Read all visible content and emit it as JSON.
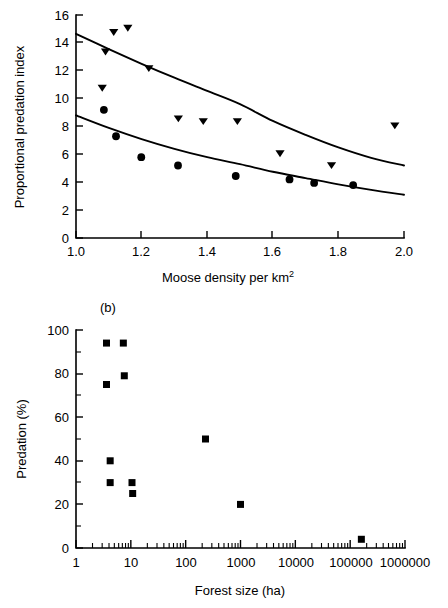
{
  "figure": {
    "background_color": "#ffffff",
    "ink_color": "#000000"
  },
  "panel_a": {
    "label": "",
    "ylabel": "Proportional predation index",
    "xlabel_main": "Moose density per km",
    "xlabel_exponent": "2",
    "y_ticks": [
      "0",
      "2",
      "4",
      "6",
      "8",
      "10",
      "12",
      "14",
      "16"
    ],
    "x_ticks": [
      "1.0",
      "1.2",
      "1.4",
      "1.6",
      "1.8",
      "2.0"
    ]
  },
  "panel_b": {
    "label": "(b)",
    "ylabel": "Predation (%)",
    "xlabel": "Forest size (ha)",
    "y_ticks": [
      "0",
      "20",
      "40",
      "60",
      "80",
      "100"
    ],
    "x_ticks": [
      "1",
      "10",
      "100",
      "1000",
      "10000",
      "100000",
      "1000000"
    ]
  },
  "chart_data": [
    {
      "type": "scatter",
      "title": "Proportional predation index vs Moose density",
      "xlabel": "Moose density per km^2",
      "ylabel": "Proportional predation index",
      "xlim": [
        1.0,
        2.0
      ],
      "ylim": [
        0,
        16
      ],
      "grid": false,
      "legend_position": "none",
      "xticks": [
        1.0,
        1.2,
        1.4,
        1.6,
        1.8,
        2.0
      ],
      "yticks": [
        0,
        2,
        4,
        6,
        8,
        10,
        12,
        14,
        16
      ],
      "series": [
        {
          "name": "upper-series-triangles",
          "marker": "triangle-down",
          "points": [
            {
              "x": 1.08,
              "y": 10.8
            },
            {
              "x": 1.09,
              "y": 13.4
            },
            {
              "x": 1.115,
              "y": 14.8
            },
            {
              "x": 1.158,
              "y": 15.1
            },
            {
              "x": 1.222,
              "y": 12.2
            },
            {
              "x": 1.312,
              "y": 8.6
            },
            {
              "x": 1.388,
              "y": 8.4
            },
            {
              "x": 1.492,
              "y": 8.4
            },
            {
              "x": 1.622,
              "y": 6.1
            },
            {
              "x": 1.779,
              "y": 5.25
            },
            {
              "x": 1.972,
              "y": 8.1
            }
          ]
        },
        {
          "name": "lower-series-circles",
          "marker": "circle",
          "points": [
            {
              "x": 1.085,
              "y": 9.2
            },
            {
              "x": 1.122,
              "y": 7.3
            },
            {
              "x": 1.199,
              "y": 5.8
            },
            {
              "x": 1.311,
              "y": 5.2
            },
            {
              "x": 1.487,
              "y": 4.45
            },
            {
              "x": 1.651,
              "y": 4.2
            },
            {
              "x": 1.726,
              "y": 3.95
            },
            {
              "x": 1.845,
              "y": 3.8
            }
          ]
        }
      ],
      "fitted_curves": [
        {
          "name": "upper-fit-curve",
          "form": "exponential-decay",
          "points": [
            {
              "x": 1.0,
              "y": 14.65
            },
            {
              "x": 1.1,
              "y": 13.55
            },
            {
              "x": 1.2,
              "y": 12.5
            },
            {
              "x": 1.3,
              "y": 11.5
            },
            {
              "x": 1.4,
              "y": 10.55
            },
            {
              "x": 1.5,
              "y": 9.6
            },
            {
              "x": 1.6,
              "y": 8.4
            },
            {
              "x": 1.7,
              "y": 7.4
            },
            {
              "x": 1.8,
              "y": 6.5
            },
            {
              "x": 1.9,
              "y": 5.75
            },
            {
              "x": 2.0,
              "y": 5.2
            }
          ]
        },
        {
          "name": "lower-fit-curve",
          "form": "exponential-decay",
          "points": [
            {
              "x": 1.0,
              "y": 8.8
            },
            {
              "x": 1.1,
              "y": 7.9
            },
            {
              "x": 1.2,
              "y": 7.1
            },
            {
              "x": 1.3,
              "y": 6.4
            },
            {
              "x": 1.4,
              "y": 5.8
            },
            {
              "x": 1.5,
              "y": 5.3
            },
            {
              "x": 1.6,
              "y": 4.75
            },
            {
              "x": 1.7,
              "y": 4.3
            },
            {
              "x": 1.8,
              "y": 3.85
            },
            {
              "x": 1.9,
              "y": 3.45
            },
            {
              "x": 2.0,
              "y": 3.1
            }
          ]
        }
      ]
    },
    {
      "type": "scatter",
      "title": "(b) Predation vs Forest size",
      "xlabel": "Forest size (ha)",
      "ylabel": "Predation (%)",
      "xscale": "log",
      "xlim": [
        1,
        1000000
      ],
      "ylim": [
        0,
        100
      ],
      "grid": false,
      "legend_position": "none",
      "xticks": [
        1,
        10,
        100,
        1000,
        10000,
        100000,
        1000000
      ],
      "yticks": [
        0,
        20,
        40,
        60,
        80,
        100
      ],
      "series": [
        {
          "name": "predation-series-squares",
          "marker": "square",
          "points": [
            {
              "x": 3.6,
              "y": 94
            },
            {
              "x": 7.3,
              "y": 94
            },
            {
              "x": 7.6,
              "y": 79
            },
            {
              "x": 3.6,
              "y": 75
            },
            {
              "x": 4.2,
              "y": 40
            },
            {
              "x": 4.2,
              "y": 30
            },
            {
              "x": 10.5,
              "y": 30
            },
            {
              "x": 10.8,
              "y": 25
            },
            {
              "x": 230,
              "y": 50
            },
            {
              "x": 1000,
              "y": 20
            },
            {
              "x": 160000,
              "y": 4
            }
          ]
        }
      ]
    }
  ]
}
